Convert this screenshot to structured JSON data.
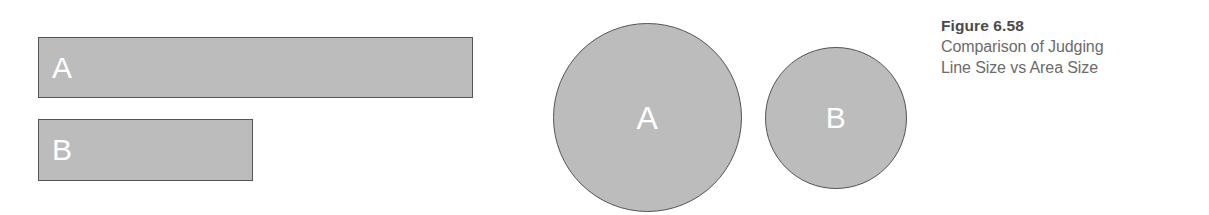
{
  "figure": {
    "caption": {
      "title": "Figure 6.58",
      "lines": [
        "Comparison of Judging",
        "Line Size vs Area Size"
      ]
    },
    "colors": {
      "shape_fill": "#bcbcbc",
      "shape_stroke": "#555555",
      "label_text": "#ffffff",
      "caption_title_text": "#4a4a4a",
      "caption_body_text": "#6b6b6b",
      "background": "#ffffff"
    },
    "bars": [
      {
        "label": "A",
        "width_px": 435,
        "height_px": 61
      },
      {
        "label": "B",
        "width_px": 215,
        "height_px": 62
      }
    ],
    "circles": [
      {
        "label": "A",
        "diameter_px": 189
      },
      {
        "label": "B",
        "diameter_px": 142
      }
    ]
  }
}
